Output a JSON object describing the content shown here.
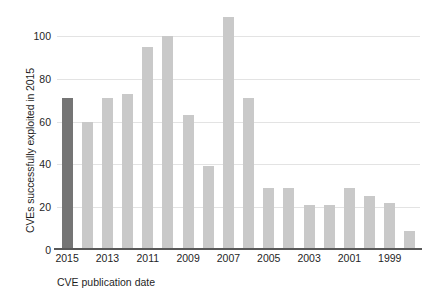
{
  "chart_data": {
    "type": "bar",
    "title": "",
    "xlabel": "CVE publication date",
    "ylabel": "CVEs successfully exploited in 2015",
    "categories": [
      "2015",
      "2014",
      "2013",
      "2012",
      "2011",
      "2010",
      "2009",
      "2008",
      "2007",
      "2006",
      "2005",
      "2004",
      "2003",
      "2002",
      "2001",
      "2000",
      "1999",
      "1998"
    ],
    "values": [
      71,
      60,
      71,
      73,
      95,
      100,
      63,
      39,
      109,
      71,
      29,
      29,
      21,
      21,
      29,
      25,
      22,
      9
    ],
    "highlight_category": "2015",
    "highlight_color": "#757575",
    "bar_color": "#c9c9c9",
    "ylim": [
      0,
      113
    ],
    "yticks": [
      0,
      20,
      40,
      60,
      80,
      100
    ],
    "xtick_labels": [
      "2015",
      "2013",
      "2011",
      "2009",
      "2007",
      "2005",
      "2003",
      "2001",
      "1999"
    ],
    "grid": true,
    "legend": "none",
    "axis_color": "#585858",
    "gridline_color": "#e3e3e3"
  }
}
